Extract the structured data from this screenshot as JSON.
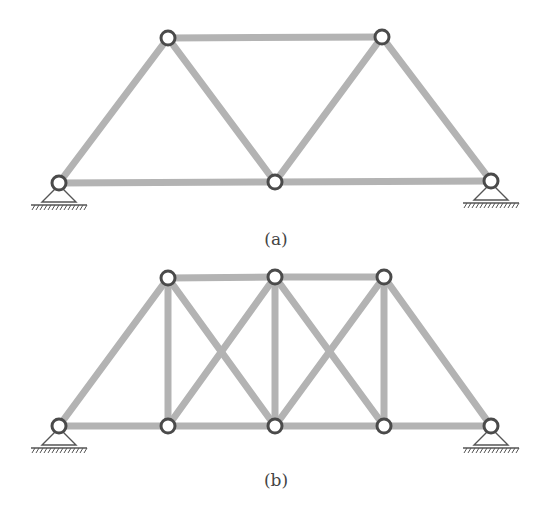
{
  "figure": {
    "colors": {
      "member": "#b3b3b3",
      "node_stroke": "#4a4a4a",
      "node_fill": "#ffffff",
      "support": "#555555",
      "caption": "#444444"
    },
    "subfigures": [
      {
        "id": "a",
        "caption": "(a)",
        "caption_pos": [
          276,
          240
        ],
        "nodes": [
          {
            "id": "A1",
            "x": 59,
            "y": 183
          },
          {
            "id": "A2",
            "x": 168,
            "y": 38
          },
          {
            "id": "A3",
            "x": 275,
            "y": 182
          },
          {
            "id": "A4",
            "x": 382,
            "y": 37
          },
          {
            "id": "A5",
            "x": 491,
            "y": 181
          }
        ],
        "members": [
          [
            "A1",
            "A3"
          ],
          [
            "A3",
            "A5"
          ],
          [
            "A2",
            "A4"
          ],
          [
            "A1",
            "A2"
          ],
          [
            "A2",
            "A3"
          ],
          [
            "A3",
            "A4"
          ],
          [
            "A4",
            "A5"
          ]
        ],
        "supports": [
          {
            "node": "A1",
            "type": "pin"
          },
          {
            "node": "A5",
            "type": "pin"
          }
        ]
      },
      {
        "id": "b",
        "caption": "(b)",
        "caption_pos": [
          276,
          481
        ],
        "nodes": [
          {
            "id": "B1",
            "x": 59,
            "y": 426
          },
          {
            "id": "B2",
            "x": 168,
            "y": 426
          },
          {
            "id": "B3",
            "x": 275,
            "y": 426
          },
          {
            "id": "B4",
            "x": 384,
            "y": 426
          },
          {
            "id": "B5",
            "x": 491,
            "y": 426
          },
          {
            "id": "T1",
            "x": 168,
            "y": 278
          },
          {
            "id": "T2",
            "x": 275,
            "y": 277
          },
          {
            "id": "T3",
            "x": 384,
            "y": 277
          }
        ],
        "members": [
          [
            "B1",
            "B2"
          ],
          [
            "B2",
            "B3"
          ],
          [
            "B3",
            "B4"
          ],
          [
            "B4",
            "B5"
          ],
          [
            "T1",
            "T2"
          ],
          [
            "T2",
            "T3"
          ],
          [
            "B1",
            "T1"
          ],
          [
            "T3",
            "B5"
          ],
          [
            "B2",
            "T1"
          ],
          [
            "B3",
            "T2"
          ],
          [
            "B4",
            "T3"
          ],
          [
            "T1",
            "B3"
          ],
          [
            "B2",
            "T2"
          ],
          [
            "T2",
            "B4"
          ],
          [
            "B3",
            "T3"
          ]
        ],
        "supports": [
          {
            "node": "B1",
            "type": "pin"
          },
          {
            "node": "B5",
            "type": "pin"
          }
        ]
      }
    ]
  }
}
